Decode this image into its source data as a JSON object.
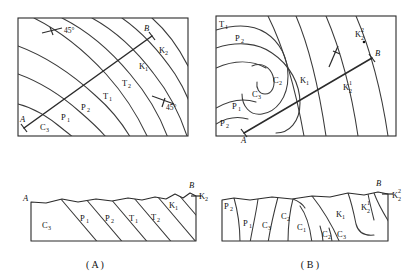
{
  "figure": {
    "title": "",
    "panels": [
      {
        "id": "panel-a",
        "caption": "( A )",
        "map": {
          "name": "map-a",
          "section_line_start": "A",
          "section_line_end": "B",
          "dip_annotations": [
            "45°",
            "45°"
          ],
          "unit_labels": [
            {
              "base": "C",
              "sub": "3",
              "sup": ""
            },
            {
              "base": "P",
              "sub": "1",
              "sup": ""
            },
            {
              "base": "P",
              "sub": "2",
              "sup": ""
            },
            {
              "base": "T",
              "sub": "1",
              "sup": ""
            },
            {
              "base": "T",
              "sub": "2",
              "sup": ""
            },
            {
              "base": "K",
              "sub": "1",
              "sup": ""
            },
            {
              "base": "K",
              "sub": "2",
              "sup": ""
            }
          ]
        },
        "section": {
          "name": "section-a",
          "left_end": "A",
          "right_end": "B",
          "unit_labels": [
            {
              "base": "C",
              "sub": "3",
              "sup": ""
            },
            {
              "base": "P",
              "sub": "1",
              "sup": ""
            },
            {
              "base": "P",
              "sub": "2",
              "sup": ""
            },
            {
              "base": "T",
              "sub": "1",
              "sup": ""
            },
            {
              "base": "T",
              "sub": "2",
              "sup": ""
            },
            {
              "base": "K",
              "sub": "1",
              "sup": ""
            },
            {
              "base": "K",
              "sub": "2",
              "sup": ""
            }
          ]
        }
      },
      {
        "id": "panel-b",
        "caption": "( B )",
        "map": {
          "name": "map-b",
          "section_line_start": "A",
          "section_line_end": "B",
          "dip_annotations": [],
          "unit_labels": [
            {
              "base": "T",
              "sub": "1",
              "sup": ""
            },
            {
              "base": "P",
              "sub": "2",
              "sup": ""
            },
            {
              "base": "P",
              "sub": "1",
              "sup": ""
            },
            {
              "base": "P",
              "sub": "2",
              "sup": ""
            },
            {
              "base": "C",
              "sub": "3",
              "sup": ""
            },
            {
              "base": "C",
              "sub": "2",
              "sup": ""
            },
            {
              "base": "K",
              "sub": "1",
              "sup": ""
            },
            {
              "base": "K",
              "sub": "2",
              "sup": "1"
            },
            {
              "base": "K",
              "sub": "2",
              "sup": "2"
            }
          ]
        },
        "section": {
          "name": "section-b",
          "left_end": "",
          "right_end": "B",
          "unit_labels": [
            {
              "base": "P",
              "sub": "2",
              "sup": ""
            },
            {
              "base": "P",
              "sub": "1",
              "sup": ""
            },
            {
              "base": "C",
              "sub": "3",
              "sup": ""
            },
            {
              "base": "C",
              "sub": "2",
              "sup": ""
            },
            {
              "base": "C",
              "sub": "1",
              "sup": ""
            },
            {
              "base": "C",
              "sub": "2",
              "sup": ""
            },
            {
              "base": "C",
              "sub": "3",
              "sup": ""
            },
            {
              "base": "K",
              "sub": "1",
              "sup": ""
            },
            {
              "base": "K",
              "sub": "2",
              "sup": "1"
            },
            {
              "base": "K",
              "sub": "2",
              "sup": "2"
            }
          ]
        }
      }
    ],
    "texts": {
      "A_italic": "A",
      "B_italic": "B",
      "angle45": "45°",
      "capA": "( A )",
      "capB": "( B )",
      "C": "C",
      "P": "P",
      "T": "T",
      "K": "K",
      "s1": "1",
      "s2": "2",
      "s3": "3"
    }
  }
}
